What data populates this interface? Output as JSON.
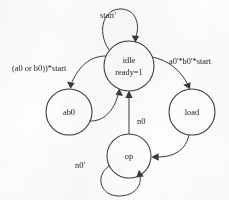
{
  "diagram": {
    "kind": "finite-state-machine",
    "states": [
      {
        "id": "idle",
        "label": "idle",
        "sublabel": "ready=1",
        "cx": 129,
        "cy": 66,
        "r": 25
      },
      {
        "id": "ab0",
        "label": "ab0",
        "sublabel": "",
        "cx": 69,
        "cy": 112,
        "r": 23
      },
      {
        "id": "load",
        "label": "load",
        "sublabel": "",
        "cx": 192,
        "cy": 112,
        "r": 23
      },
      {
        "id": "op",
        "label": "op",
        "sublabel": "",
        "cx": 129,
        "cy": 156,
        "r": 22
      }
    ],
    "transitions": [
      {
        "id": "idle-self",
        "from": "idle",
        "to": "idle",
        "label": "start'",
        "label_x": 108,
        "label_y": 16,
        "anchor": "middle"
      },
      {
        "id": "idle-to-ab0",
        "from": "idle",
        "to": "ab0",
        "label": "(a0 or b0))*start",
        "label_x": 12,
        "label_y": 69,
        "anchor": "start"
      },
      {
        "id": "ab0-to-idle",
        "from": "ab0",
        "to": "idle",
        "label": "",
        "label_x": 0,
        "label_y": 0,
        "anchor": "middle"
      },
      {
        "id": "idle-to-load",
        "from": "idle",
        "to": "load",
        "label": "a0'*b0'*start",
        "label_x": 169,
        "label_y": 62,
        "anchor": "start"
      },
      {
        "id": "load-to-op",
        "from": "load",
        "to": "op",
        "label": "",
        "label_x": 0,
        "label_y": 0,
        "anchor": "middle"
      },
      {
        "id": "op-to-idle",
        "from": "op",
        "to": "idle",
        "label": "n0",
        "label_x": 137,
        "label_y": 122,
        "anchor": "start"
      },
      {
        "id": "op-self",
        "from": "op",
        "to": "op",
        "label": "n0'",
        "label_x": 85,
        "label_y": 166,
        "anchor": "end"
      }
    ],
    "colors": {
      "ink": "#3a3a3a",
      "text": "#1d1d1d",
      "background": "#fdfdfd"
    }
  }
}
